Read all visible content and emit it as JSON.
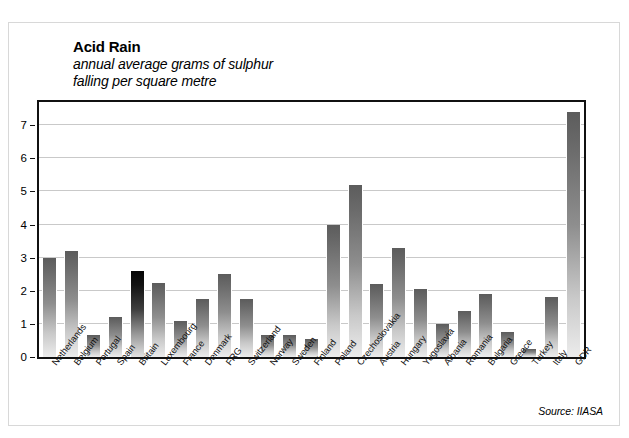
{
  "chart_data": {
    "type": "bar",
    "title": "Acid Rain",
    "subtitle_lines": [
      "annual average grams of sulphur",
      "falling per square metre"
    ],
    "xlabel": "",
    "ylabel": "",
    "ylim": [
      0,
      7.7
    ],
    "yticks": [
      0,
      1,
      2,
      3,
      4,
      5,
      6,
      7
    ],
    "ytick_labels": [
      "0",
      "1",
      "2",
      "3",
      "4",
      "5",
      "6",
      "7"
    ],
    "grid": true,
    "legend": "none",
    "source": "Source: IIASA",
    "highlight_category": "Britain",
    "categories": [
      "Netherlands",
      "Belgium",
      "Portugal",
      "Spain",
      "Britain",
      "Luxembourg",
      "France",
      "Denmark",
      "FRG",
      "Switzerland",
      "Norway",
      "Sweden",
      "Finland",
      "Poland",
      "Czechoslovakia",
      "Austria",
      "Hungary",
      "Yugoslavia",
      "Albania",
      "Romania",
      "Bulgaria",
      "Greece",
      "Turkey",
      "Italy",
      "GDR"
    ],
    "values": [
      3.0,
      3.2,
      0.65,
      1.2,
      2.6,
      2.25,
      1.1,
      1.75,
      2.5,
      1.75,
      0.65,
      0.65,
      0.55,
      4.0,
      5.2,
      2.2,
      3.3,
      2.05,
      1.0,
      1.4,
      1.9,
      0.75,
      0.25,
      1.8,
      7.4
    ],
    "units": "grams of sulphur per square metre per year"
  },
  "colors": {
    "bar_top": "#5c5c5c",
    "bar_bottom": "#ececec",
    "highlight_top": "#050505",
    "frame": "#111111",
    "gridline": "#c9c9c9",
    "background": "#ffffff"
  }
}
